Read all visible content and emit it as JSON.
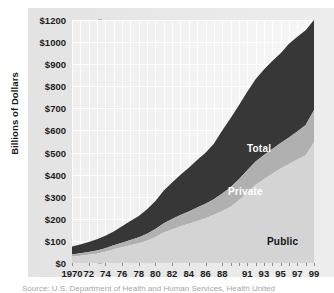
{
  "axes": {
    "ylabel": "Billions of Dollars",
    "yticks": [
      "$1200",
      "$1000",
      "$900",
      "$800",
      "$700",
      "$600",
      "$500",
      "$400",
      "$300",
      "$200",
      "$100",
      "$0"
    ],
    "xticks": [
      "1970",
      "72",
      "74",
      "76",
      "78",
      "80",
      "82",
      "84",
      "86",
      "88",
      "91",
      "93",
      "95",
      "97",
      "99"
    ]
  },
  "series_labels": {
    "total": "Total",
    "private": "Private",
    "public": "Public"
  },
  "caption": {
    "partial_line": "Source: U.S. Department of Health and Human Services, Health United"
  },
  "colors": {
    "total_band": "#373737",
    "private_band": "#b0b0b0",
    "public_band": "#d4d4d4",
    "plot_background": "#f2f2f2",
    "panel_background": "#e6e6e6",
    "gridline": "#ffffff",
    "tick_text": "#1c1c1c"
  },
  "chart_data": {
    "type": "area",
    "title": "",
    "subtitle": "",
    "xlabel": "",
    "ylabel": "Billions of Dollars",
    "stacked": true,
    "grid": true,
    "legend": "in-plot labels",
    "xlim": [
      1970,
      1999
    ],
    "ylim": [
      0,
      1200
    ],
    "y_axis_note": "Non-linear top segment: ticks step by 100 from $0 to $1000, then jump to $1200 with equal spacing",
    "y_tick_values": [
      1200,
      1000,
      900,
      800,
      700,
      600,
      500,
      400,
      300,
      200,
      100,
      0
    ],
    "x_tick_labels": [
      "1970",
      "72",
      "74",
      "76",
      "78",
      "80",
      "82",
      "84",
      "86",
      "88",
      "91",
      "93",
      "95",
      "97",
      "99"
    ],
    "x": [
      1970,
      1971,
      1972,
      1973,
      1974,
      1975,
      1976,
      1977,
      1978,
      1979,
      1980,
      1981,
      1982,
      1983,
      1984,
      1985,
      1986,
      1987,
      1988,
      1989,
      1990,
      1991,
      1992,
      1993,
      1994,
      1995,
      1996,
      1997,
      1998,
      1999
    ],
    "series": [
      {
        "name": "Public",
        "color": "#d4d4d4",
        "values": [
          28,
          33,
          37,
          42,
          51,
          62,
          71,
          80,
          89,
          101,
          118,
          138,
          152,
          166,
          178,
          190,
          203,
          218,
          234,
          255,
          284,
          319,
          354,
          379,
          404,
          428,
          448,
          468,
          488,
          546
        ]
      },
      {
        "name": "Private",
        "color": "#b0b0b0",
        "values": [
          47,
          51,
          58,
          65,
          72,
          81,
          95,
          110,
          124,
          142,
          163,
          190,
          212,
          233,
          253,
          276,
          296,
          322,
          366,
          400,
          430,
          456,
          478,
          497,
          510,
          522,
          545,
          580,
          620,
          124
        ]
      },
      {
        "name": "Total",
        "color": "#373737",
        "values": [
          75,
          84,
          95,
          107,
          123,
          143,
          166,
          190,
          213,
          243,
          281,
          328,
          364,
          399,
          431,
          466,
          499,
          540,
          600,
          655,
          714,
          775,
          832,
          876,
          914,
          950,
          993,
          1048,
          1108,
          1210
        ]
      }
    ]
  }
}
